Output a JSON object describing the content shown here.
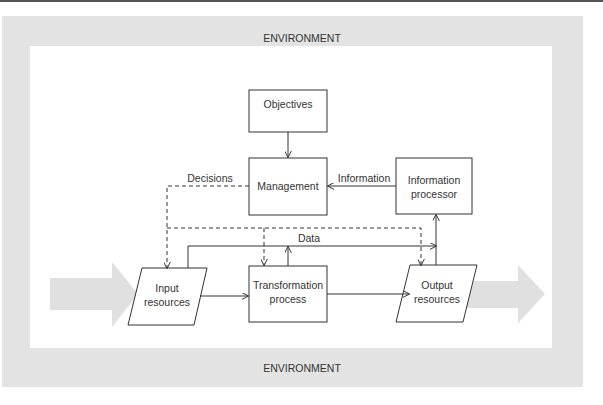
{
  "environment": {
    "top_label": "ENVIRONMENT",
    "bottom_label": "ENVIRONMENT"
  },
  "nodes": {
    "objectives": {
      "label": "Objectives"
    },
    "management": {
      "label": "Management"
    },
    "info_processor": {
      "line1": "Information",
      "line2": "processor"
    },
    "input": {
      "line1": "Input",
      "line2": "resources"
    },
    "transformation": {
      "line1": "Transformation",
      "line2": "process"
    },
    "output": {
      "line1": "Output",
      "line2": "resources"
    }
  },
  "edges": {
    "decisions": "Decisions",
    "information": "Information",
    "data": "Data"
  },
  "colors": {
    "environment": "#e3e3e3",
    "line": "#333333",
    "flow_arrow": "#dcdcdc"
  }
}
